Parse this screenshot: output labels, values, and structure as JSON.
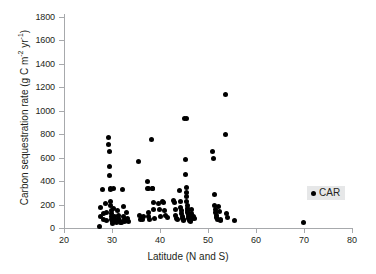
{
  "chart_data": {
    "type": "scatter",
    "title": "",
    "xlabel": "Latitude (N and S)",
    "ylabel": "Carbon sequestration rate (g C m",
    "ylabel_sup1": "-2",
    "ylabel_mid": " yr",
    "ylabel_sup2": "-1",
    "ylabel_end": ")",
    "ylabel_full": "Carbon sequestration rate (g C m-2 yr-1)",
    "xlim": [
      20,
      80
    ],
    "ylim": [
      0,
      1800
    ],
    "xticks": [
      20,
      30,
      40,
      50,
      60,
      70,
      80
    ],
    "yticks": [
      0,
      200,
      400,
      600,
      800,
      1000,
      1200,
      1400,
      1600,
      1800
    ],
    "grid": false,
    "legend_position": "right-middle",
    "marker_color": "#000000",
    "axis_color": "#a7a9ac",
    "background_color": "#ffffff",
    "legend": [
      {
        "name": "CAR",
        "marker": "filled-circle",
        "color": "#000000"
      }
    ],
    "series": [
      {
        "name": "CAR",
        "points": [
          [
            27.4,
            10
          ],
          [
            27.5,
            95
          ],
          [
            27.6,
            175
          ],
          [
            28.0,
            330
          ],
          [
            28.2,
            120
          ],
          [
            28.3,
            75
          ],
          [
            28.7,
            205
          ],
          [
            28.8,
            130
          ],
          [
            28.9,
            60
          ],
          [
            29.2,
            770
          ],
          [
            29.3,
            715
          ],
          [
            29.4,
            655
          ],
          [
            29.5,
            525
          ],
          [
            29.5,
            450
          ],
          [
            29.6,
            340
          ],
          [
            29.6,
            325
          ],
          [
            29.7,
            230
          ],
          [
            29.7,
            195
          ],
          [
            29.8,
            150
          ],
          [
            29.8,
            120
          ],
          [
            29.9,
            95
          ],
          [
            29.9,
            70
          ],
          [
            30.0,
            55
          ],
          [
            30.1,
            40
          ],
          [
            30.3,
            335
          ],
          [
            30.4,
            165
          ],
          [
            30.5,
            95
          ],
          [
            30.6,
            75
          ],
          [
            30.7,
            60
          ],
          [
            30.9,
            45
          ],
          [
            31.2,
            150
          ],
          [
            31.3,
            110
          ],
          [
            31.4,
            80
          ],
          [
            31.5,
            60
          ],
          [
            31.7,
            50
          ],
          [
            31.9,
            45
          ],
          [
            32.2,
            330
          ],
          [
            32.3,
            185
          ],
          [
            32.4,
            100
          ],
          [
            32.5,
            70
          ],
          [
            32.6,
            55
          ],
          [
            32.8,
            60
          ],
          [
            33.1,
            130
          ],
          [
            33.3,
            80
          ],
          [
            33.5,
            55
          ],
          [
            35.6,
            565
          ],
          [
            35.8,
            110
          ],
          [
            35.9,
            75
          ],
          [
            36.1,
            85
          ],
          [
            36.3,
            70
          ],
          [
            36.5,
            100
          ],
          [
            37.3,
            395
          ],
          [
            37.4,
            340
          ],
          [
            37.5,
            335
          ],
          [
            37.6,
            130
          ],
          [
            37.7,
            100
          ],
          [
            37.8,
            70
          ],
          [
            38.2,
            755
          ],
          [
            38.4,
            340
          ],
          [
            38.5,
            335
          ],
          [
            38.6,
            215
          ],
          [
            38.7,
            160
          ],
          [
            38.8,
            85
          ],
          [
            39.6,
            205
          ],
          [
            39.8,
            155
          ],
          [
            40.0,
            100
          ],
          [
            40.6,
            230
          ],
          [
            40.8,
            215
          ],
          [
            41.0,
            150
          ],
          [
            41.2,
            110
          ],
          [
            41.5,
            90
          ],
          [
            42.8,
            235
          ],
          [
            43.0,
            215
          ],
          [
            43.2,
            160
          ],
          [
            43.3,
            110
          ],
          [
            43.5,
            85
          ],
          [
            43.7,
            75
          ],
          [
            44.0,
            320
          ],
          [
            44.2,
            230
          ],
          [
            44.3,
            175
          ],
          [
            44.4,
            150
          ],
          [
            44.5,
            120
          ],
          [
            44.6,
            95
          ],
          [
            44.7,
            80
          ],
          [
            44.8,
            70
          ],
          [
            44.9,
            60
          ],
          [
            45.2,
            935
          ],
          [
            45.5,
            935
          ],
          [
            45.3,
            585
          ],
          [
            45.4,
            455
          ],
          [
            45.5,
            345
          ],
          [
            45.5,
            300
          ],
          [
            45.6,
            270
          ],
          [
            45.6,
            230
          ],
          [
            45.7,
            195
          ],
          [
            45.7,
            170
          ],
          [
            45.8,
            150
          ],
          [
            45.8,
            130
          ],
          [
            45.9,
            115
          ],
          [
            45.9,
            100
          ],
          [
            46.0,
            85
          ],
          [
            46.1,
            70
          ],
          [
            46.2,
            60
          ],
          [
            46.3,
            55
          ],
          [
            46.5,
            155
          ],
          [
            46.6,
            120
          ],
          [
            46.7,
            95
          ],
          [
            46.8,
            80
          ],
          [
            47.0,
            95
          ],
          [
            47.2,
            85
          ],
          [
            51.0,
            655
          ],
          [
            51.2,
            595
          ],
          [
            51.3,
            285
          ],
          [
            51.4,
            195
          ],
          [
            51.5,
            160
          ],
          [
            51.6,
            130
          ],
          [
            51.7,
            110
          ],
          [
            51.8,
            90
          ],
          [
            51.9,
            70
          ],
          [
            52.1,
            180
          ],
          [
            52.3,
            145
          ],
          [
            52.5,
            70
          ],
          [
            52.7,
            60
          ],
          [
            53.6,
            1140
          ],
          [
            53.7,
            800
          ],
          [
            53.9,
            120
          ],
          [
            54.0,
            90
          ],
          [
            55.6,
            65
          ],
          [
            69.8,
            45
          ]
        ]
      }
    ]
  }
}
